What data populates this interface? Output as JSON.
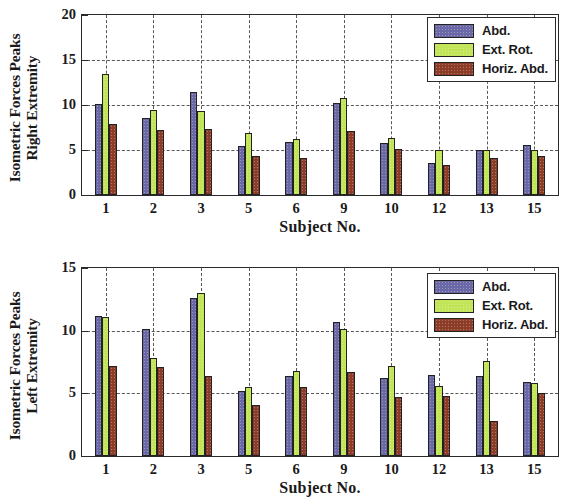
{
  "figure": {
    "xlabel": "Subject No.",
    "categories": [
      "1",
      "2",
      "3",
      "5",
      "6",
      "9",
      "10",
      "12",
      "13",
      "15"
    ],
    "series_names": [
      "Abd.",
      "Ext. Rot.",
      "Horiz. Abd."
    ],
    "colors": {
      "abd": "#6a68a6",
      "ext_rot": "#c2e457",
      "horiz_abd": "#8d3c28",
      "axis": "#2b2b2b",
      "grid": "#3a3a3a"
    }
  },
  "chart_data": [
    {
      "type": "bar",
      "title": "",
      "ylabel_line1": "Isometric Forces Peaks",
      "ylabel_line2": "Right Extremity",
      "xlabel": "Subject No.",
      "categories": [
        "1",
        "2",
        "3",
        "5",
        "6",
        "9",
        "10",
        "12",
        "13",
        "15"
      ],
      "ylim": [
        0,
        20
      ],
      "yticks": [
        0,
        5,
        10,
        15,
        20
      ],
      "grid": true,
      "legend_position": "top-right",
      "series": [
        {
          "name": "Abd.",
          "values": [
            10.1,
            8.6,
            11.4,
            5.5,
            5.9,
            10.2,
            5.8,
            3.6,
            5.0,
            5.6
          ]
        },
        {
          "name": "Ext. Rot.",
          "values": [
            13.4,
            9.5,
            9.3,
            6.9,
            6.2,
            10.8,
            6.3,
            5.0,
            5.0,
            5.0
          ]
        },
        {
          "name": "Horiz. Abd.",
          "values": [
            7.9,
            7.2,
            7.3,
            4.3,
            4.1,
            7.1,
            5.1,
            3.3,
            4.1,
            4.3
          ]
        }
      ]
    },
    {
      "type": "bar",
      "title": "",
      "ylabel_line1": "Isometric Forces Peaks",
      "ylabel_line2": "Left Extremity",
      "xlabel": "Subject No.",
      "categories": [
        "1",
        "2",
        "3",
        "5",
        "6",
        "9",
        "10",
        "12",
        "13",
        "15"
      ],
      "ylim": [
        0,
        15
      ],
      "yticks": [
        0,
        5,
        10,
        15
      ],
      "grid": true,
      "legend_position": "top-right",
      "series": [
        {
          "name": "Abd.",
          "values": [
            11.2,
            10.1,
            12.6,
            5.2,
            6.4,
            10.7,
            6.2,
            6.5,
            6.4,
            5.9
          ]
        },
        {
          "name": "Ext. Rot.",
          "values": [
            11.1,
            7.8,
            13.0,
            5.5,
            6.8,
            10.1,
            7.2,
            5.6,
            7.6,
            5.8
          ]
        },
        {
          "name": "Horiz. Abd.",
          "values": [
            7.2,
            7.1,
            6.4,
            4.1,
            5.5,
            6.7,
            4.7,
            4.8,
            2.8,
            5.0
          ]
        }
      ]
    }
  ]
}
